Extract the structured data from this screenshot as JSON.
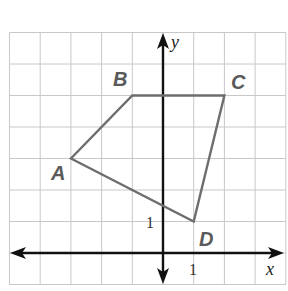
{
  "diagram": {
    "type": "coordinate-plane-quadrilateral",
    "grid": {
      "x_min": -5,
      "x_max": 4,
      "y_min": -1,
      "y_max": 7,
      "step": 1
    },
    "axes": {
      "x_label": "x",
      "y_label": "y",
      "x_tick_label": "1",
      "y_tick_label": "1"
    },
    "vertices": [
      {
        "label": "A",
        "x": -3,
        "y": 3
      },
      {
        "label": "B",
        "x": -1,
        "y": 5
      },
      {
        "label": "C",
        "x": 2,
        "y": 5
      },
      {
        "label": "D",
        "x": 1,
        "y": 1
      }
    ],
    "colors": {
      "grid": "#c8c8c8",
      "axes": "#111111",
      "polygon": "#6d6d6d",
      "labels": "#5a5a5a"
    }
  }
}
